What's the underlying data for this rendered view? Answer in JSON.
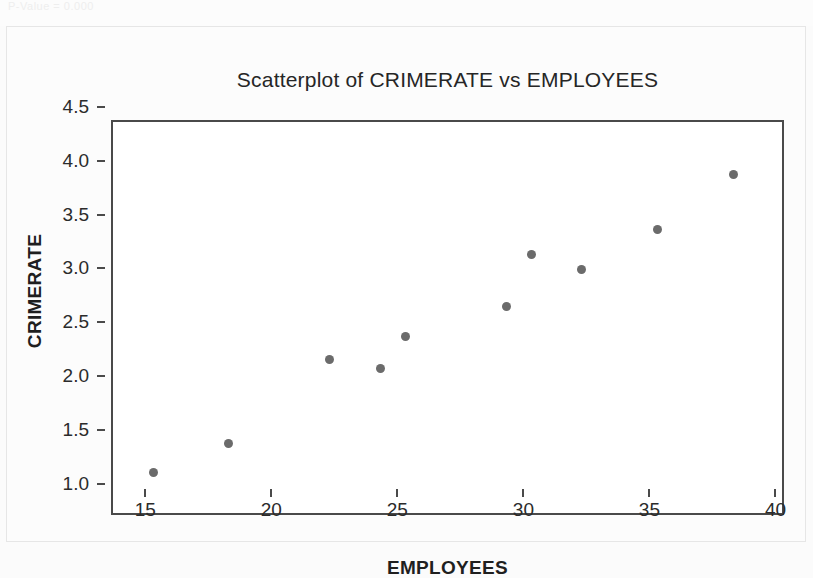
{
  "page": {
    "top_note": "P-Value = 0.000"
  },
  "figure": {
    "title": "Scatterplot of CRIMERATE vs EMPLOYEES",
    "x_axis_title": "EMPLOYEES",
    "y_axis_title": "CRIMERATE",
    "point_color": "#6b6b6b",
    "frame_color": "#4a4a4a",
    "background_color": "#ffffff"
  },
  "chart_data": {
    "type": "scatter",
    "title": "Scatterplot of CRIMERATE vs EMPLOYEES",
    "xlabel": "EMPLOYEES",
    "ylabel": "CRIMERATE",
    "xlim": [
      13.4,
      40.1
    ],
    "ylim": [
      0.95,
      4.62
    ],
    "xticks": [
      15,
      20,
      25,
      30,
      35,
      40
    ],
    "xtick_labels": [
      "15",
      "20",
      "25",
      "30",
      "35",
      "40"
    ],
    "yticks": [
      1.0,
      1.5,
      2.0,
      2.5,
      3.0,
      3.5,
      4.0,
      4.5
    ],
    "ytick_labels": [
      "1.0",
      "1.5",
      "2.0",
      "2.5",
      "3.0",
      "3.5",
      "4.0",
      "4.5"
    ],
    "grid": false,
    "legend": false,
    "marker": "circle",
    "marker_color": "#6b6b6b",
    "marker_size_px": 9,
    "x": [
      15,
      18,
      22,
      24,
      25,
      29,
      30,
      32,
      35,
      38
    ],
    "y": [
      1.36,
      1.63,
      2.41,
      2.33,
      2.63,
      2.91,
      3.39,
      3.25,
      3.62,
      4.13
    ],
    "points": [
      {
        "x": 15,
        "y": 1.36
      },
      {
        "x": 18,
        "y": 1.63
      },
      {
        "x": 22,
        "y": 2.41
      },
      {
        "x": 24,
        "y": 2.33
      },
      {
        "x": 25,
        "y": 2.63
      },
      {
        "x": 29,
        "y": 2.91
      },
      {
        "x": 30,
        "y": 3.39
      },
      {
        "x": 32,
        "y": 3.25
      },
      {
        "x": 35,
        "y": 3.62
      },
      {
        "x": 38,
        "y": 4.13
      }
    ]
  }
}
